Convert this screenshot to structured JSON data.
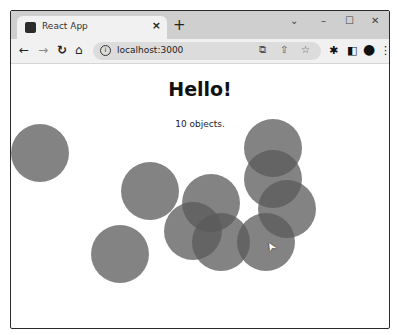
{
  "browser": {
    "tab": {
      "title": "React App",
      "close": "×",
      "favicon": "react-favicon"
    },
    "new_tab": "+",
    "window_controls": {
      "dropdown": "⌄",
      "minimize": "–",
      "maximize": "☐",
      "close": "✕"
    },
    "nav": {
      "back": "←",
      "forward": "→",
      "reload": "↻",
      "home": "⌂"
    },
    "address": {
      "info_icon": "i",
      "url": "localhost:3000"
    },
    "omnibox_icons": {
      "install": "⧉",
      "share": "⇪",
      "bookmark": "☆"
    },
    "toolbar_icons": {
      "extensions": "✱",
      "sidepanel": "◧",
      "profile": "●",
      "menu": "⋮"
    }
  },
  "page": {
    "heading": "Hello!",
    "count_text": "10 objects.",
    "circle_color": "#5a5a5a",
    "circles": [
      {
        "cx": 40,
        "cy": 153
      },
      {
        "cx": 150,
        "cy": 191
      },
      {
        "cx": 120,
        "cy": 254
      },
      {
        "cx": 211,
        "cy": 203
      },
      {
        "cx": 193,
        "cy": 231
      },
      {
        "cx": 221,
        "cy": 242
      },
      {
        "cx": 273,
        "cy": 148
      },
      {
        "cx": 273,
        "cy": 179
      },
      {
        "cx": 287,
        "cy": 209
      },
      {
        "cx": 266,
        "cy": 242
      }
    ],
    "cursor": {
      "x": 266,
      "y": 240,
      "glyph": "➤"
    }
  }
}
